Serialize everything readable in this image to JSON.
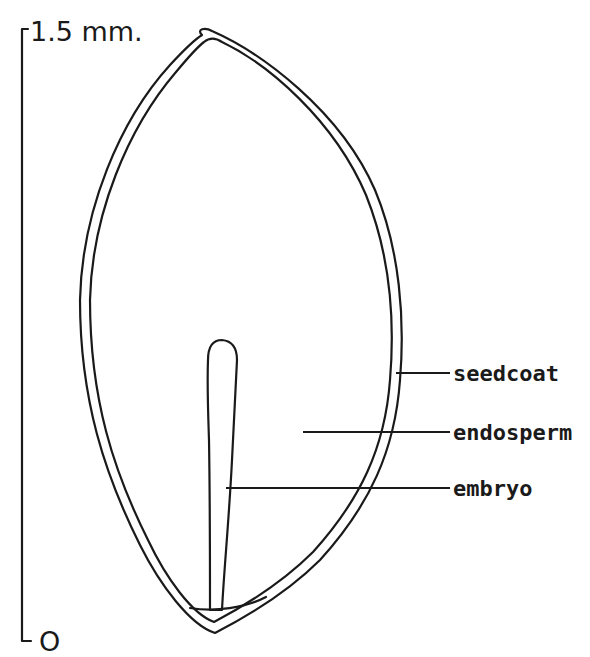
{
  "figure": {
    "type": "botanical-diagram",
    "ink_color": "#1a1a1a",
    "background_color": "#ffffff"
  },
  "scale_bar": {
    "top_label": "1.5 mm.",
    "bottom_label": "O"
  },
  "labels": [
    {
      "id": "seedcoat",
      "text": "seedcoat"
    },
    {
      "id": "endosperm",
      "text": "endosperm"
    },
    {
      "id": "embryo",
      "text": "embryo"
    }
  ]
}
